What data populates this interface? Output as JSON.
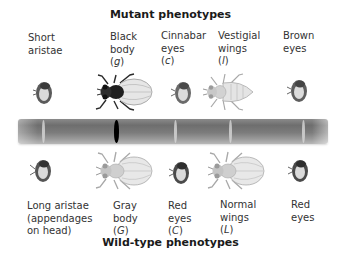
{
  "mutant_title": "Mutant phenotypes",
  "wildtype_title": "Wild-type phenotypes",
  "mutants": [
    {
      "line1": "Short",
      "line2": "aristae",
      "allele": ""
    },
    {
      "line1": "Black",
      "line2": "body",
      "allele": "g"
    },
    {
      "line1": "Cinnabar",
      "line2": "eyes",
      "allele": "c"
    },
    {
      "line1": "Vestigial",
      "line2": "wings",
      "allele": "l"
    },
    {
      "line1": "Brown",
      "line2": "eyes",
      "allele": ""
    }
  ],
  "wildtypes": [
    {
      "line1": "Long aristae",
      "line2": "(appendages",
      "line3": "on head)",
      "allele": ""
    },
    {
      "line1": "Gray",
      "line2": "body",
      "allele": "G"
    },
    {
      "line1": "Red",
      "line2": "eyes",
      "allele": "C"
    },
    {
      "line1": "Normal",
      "line2": "wings",
      "allele": "L"
    },
    {
      "line1": "Red",
      "line2": "eyes",
      "allele": ""
    }
  ],
  "chromosome": {
    "bands": [
      {
        "x": 24,
        "type": "light"
      },
      {
        "x": 96,
        "type": "black"
      },
      {
        "x": 156,
        "type": "light"
      },
      {
        "x": 211,
        "type": "light"
      },
      {
        "x": 284,
        "type": "light"
      }
    ],
    "colors": {
      "body": "#7a7a7a",
      "band_light": "#d8d8d8",
      "band_marker": "#000000"
    }
  }
}
